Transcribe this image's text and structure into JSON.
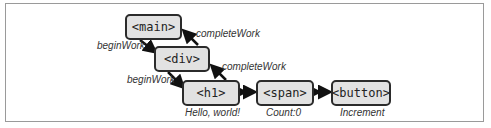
{
  "nodes": {
    "main": "<main>",
    "div": "<div>",
    "h1": "<h1>",
    "span": "<span>",
    "button": "<button>"
  },
  "edges": {
    "begin_work_1": "beginWork",
    "begin_work_2": "beginWork",
    "complete_work_1": "completeWork",
    "complete_work_2": "completeWork"
  },
  "captions": {
    "h1": "Hello, world!",
    "span": "Count:0",
    "button": "Increment"
  },
  "colors": {
    "node_fill": "#e2e2e2",
    "node_border": "#2b2b2b",
    "arrow": "#111111"
  }
}
